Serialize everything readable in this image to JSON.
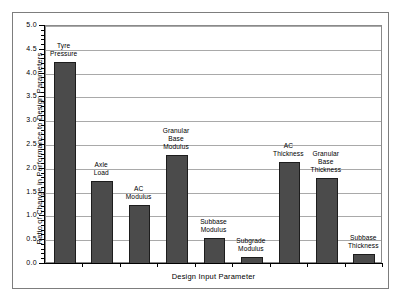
{
  "chart_data": {
    "type": "bar",
    "title": "",
    "xlabel": "Design Input Parameter",
    "ylabel": "Ratio of Change in Performance to Design Parameters",
    "ylim": [
      0.0,
      5.0
    ],
    "ytick_step": 0.5,
    "grid": true,
    "legend": "none",
    "categories": [
      "Tyre Pressure",
      "Axle Load",
      "AC Modulus",
      "Granular Base Modulus",
      "Subbase Modulus",
      "Subgrade Modulus",
      "AC Thickness",
      "Granular Base Thickness",
      "Subbase Thickness"
    ],
    "values": [
      4.25,
      1.75,
      1.25,
      2.3,
      0.55,
      0.15,
      2.15,
      1.8,
      0.2
    ],
    "bar_color": "#4b4b4b",
    "bar_edge_color": "#1d1d1d",
    "grid_color": "#a9a9a9",
    "axis_color": "#000000"
  },
  "axes": {
    "ytick_labels": [
      "5.0",
      "4.5",
      "4.0",
      "3.5",
      "3.0",
      "2.5",
      "2.0",
      "1.5",
      "1.0",
      "0.5",
      "0.0"
    ],
    "ytick_values": [
      5.0,
      4.5,
      4.0,
      3.5,
      3.0,
      2.5,
      2.0,
      1.5,
      1.0,
      0.5,
      0.0
    ],
    "y_axis_title": "Ratio of Change in Performance to Design Parameters",
    "x_axis_title": "Design Input Parameter"
  },
  "bar_labels": [
    "Tyre\nPressure",
    "Axle\nLoad",
    "AC\nModulus",
    "Granular\nBase\nModulus",
    "Subbase\nModulus",
    "Subgrade\nModulus",
    "AC\nThickness",
    "Granular\nBase\nThickness",
    "Subbase\nThickness"
  ]
}
